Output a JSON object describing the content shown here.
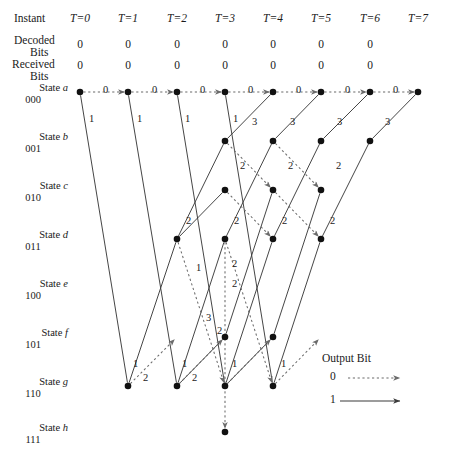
{
  "figure": {
    "type": "trellis-diagram",
    "background": "#ffffff",
    "line_color": "#3b3b3b",
    "node_color": "#111111"
  },
  "header": {
    "instant_label": "Instant",
    "decoded_label_line1": "Decoded",
    "decoded_label_line2": "Bits",
    "received_label_line1": "Received",
    "received_label_line2": "Bits",
    "time_columns": [
      {
        "label": "T=0",
        "x": 80
      },
      {
        "label": "T=1",
        "x": 128
      },
      {
        "label": "T=2",
        "x": 177
      },
      {
        "label": "T=3",
        "x": 225
      },
      {
        "label": "T=4",
        "x": 273
      },
      {
        "label": "T=5",
        "x": 321
      },
      {
        "label": "T=6",
        "x": 370
      },
      {
        "label": "T=7",
        "x": 418
      }
    ],
    "decoded_bits": [
      "0",
      "0",
      "0",
      "0",
      "0",
      "0",
      "0"
    ],
    "received_bits": [
      "0",
      "0",
      "0",
      "0",
      "0",
      "0",
      "0"
    ]
  },
  "states": [
    {
      "key": "a",
      "name": "State a",
      "bits": "000",
      "y": 92
    },
    {
      "key": "b",
      "name": "State b",
      "bits": "001",
      "y": 141
    },
    {
      "key": "c",
      "name": "State c",
      "bits": "010",
      "y": 190
    },
    {
      "key": "d",
      "name": "State d",
      "bits": "011",
      "y": 239
    },
    {
      "key": "e",
      "name": "State e",
      "bits": "100",
      "y": 288
    },
    {
      "key": "f",
      "name": "State f",
      "bits": "101",
      "y": 337
    },
    {
      "key": "g",
      "name": "State g",
      "bits": "110",
      "y": 386
    },
    {
      "key": "h",
      "name": "State h",
      "bits": "111",
      "y": 432
    }
  ],
  "legend": {
    "title": "Output Bit",
    "entries": [
      {
        "label": "0",
        "style": "dotted"
      },
      {
        "label": "1",
        "style": "solid"
      }
    ]
  },
  "chart_data": {
    "type": "diagram",
    "nodes": [
      {
        "id": "a0",
        "state": "a",
        "t": 0,
        "x": 80,
        "y": 92
      },
      {
        "id": "a1",
        "state": "a",
        "t": 1,
        "x": 128,
        "y": 92
      },
      {
        "id": "a2",
        "state": "a",
        "t": 2,
        "x": 177,
        "y": 92
      },
      {
        "id": "a3",
        "state": "a",
        "t": 3,
        "x": 225,
        "y": 92
      },
      {
        "id": "a4",
        "state": "a",
        "t": 4,
        "x": 273,
        "y": 92
      },
      {
        "id": "a5",
        "state": "a",
        "t": 5,
        "x": 321,
        "y": 92
      },
      {
        "id": "a6",
        "state": "a",
        "t": 6,
        "x": 370,
        "y": 92
      },
      {
        "id": "a7",
        "state": "a",
        "t": 7,
        "x": 418,
        "y": 92
      },
      {
        "id": "b3",
        "state": "b",
        "t": 3,
        "x": 225,
        "y": 141
      },
      {
        "id": "b4",
        "state": "b",
        "t": 4,
        "x": 273,
        "y": 141
      },
      {
        "id": "b5",
        "state": "b",
        "t": 5,
        "x": 321,
        "y": 141
      },
      {
        "id": "b6",
        "state": "b",
        "t": 6,
        "x": 370,
        "y": 141
      },
      {
        "id": "c3",
        "state": "c",
        "t": 3,
        "x": 225,
        "y": 190
      },
      {
        "id": "c4",
        "state": "c",
        "t": 4,
        "x": 273,
        "y": 190
      },
      {
        "id": "c5",
        "state": "c",
        "t": 5,
        "x": 321,
        "y": 190
      },
      {
        "id": "d2",
        "state": "d",
        "t": 2,
        "x": 177,
        "y": 239
      },
      {
        "id": "d3",
        "state": "d",
        "t": 3,
        "x": 225,
        "y": 239
      },
      {
        "id": "d4",
        "state": "d",
        "t": 4,
        "x": 273,
        "y": 239
      },
      {
        "id": "d5",
        "state": "d",
        "t": 5,
        "x": 321,
        "y": 239
      },
      {
        "id": "f3",
        "state": "f",
        "t": 3,
        "x": 225,
        "y": 337
      },
      {
        "id": "f4",
        "state": "f",
        "t": 4,
        "x": 273,
        "y": 337
      },
      {
        "id": "g1",
        "state": "g",
        "t": 1,
        "x": 128,
        "y": 386
      },
      {
        "id": "g2",
        "state": "g",
        "t": 2,
        "x": 177,
        "y": 386
      },
      {
        "id": "g3",
        "state": "g",
        "t": 3,
        "x": 225,
        "y": 386
      },
      {
        "id": "g4",
        "state": "g",
        "t": 4,
        "x": 273,
        "y": 386
      },
      {
        "id": "h3",
        "state": "h",
        "t": 3,
        "x": 225,
        "y": 432
      }
    ],
    "edges": [
      {
        "from": [
          80,
          92
        ],
        "to": [
          128,
          92
        ],
        "bit": 0
      },
      {
        "from": [
          128,
          92
        ],
        "to": [
          177,
          92
        ],
        "bit": 0
      },
      {
        "from": [
          177,
          92
        ],
        "to": [
          225,
          92
        ],
        "bit": 0
      },
      {
        "from": [
          225,
          92
        ],
        "to": [
          273,
          92
        ],
        "bit": 0
      },
      {
        "from": [
          273,
          92
        ],
        "to": [
          321,
          92
        ],
        "bit": 0
      },
      {
        "from": [
          321,
          92
        ],
        "to": [
          370,
          92
        ],
        "bit": 0
      },
      {
        "from": [
          370,
          92
        ],
        "to": [
          418,
          92
        ],
        "bit": 0
      },
      {
        "from": [
          80,
          92
        ],
        "to": [
          128,
          386
        ],
        "bit": 1
      },
      {
        "from": [
          128,
          92
        ],
        "to": [
          177,
          386
        ],
        "bit": 1
      },
      {
        "from": [
          177,
          92
        ],
        "to": [
          225,
          386
        ],
        "bit": 1
      },
      {
        "from": [
          225,
          92
        ],
        "to": [
          273,
          386
        ],
        "bit": 1
      },
      {
        "from": [
          177,
          239
        ],
        "to": [
          225,
          141
        ],
        "bit": 1
      },
      {
        "from": [
          225,
          239
        ],
        "to": [
          273,
          141
        ],
        "bit": 1
      },
      {
        "from": [
          273,
          239
        ],
        "to": [
          321,
          141
        ],
        "bit": 1
      },
      {
        "from": [
          321,
          239
        ],
        "to": [
          370,
          141
        ],
        "bit": 1
      },
      {
        "from": [
          225,
          141
        ],
        "to": [
          273,
          92
        ],
        "bit": 1
      },
      {
        "from": [
          273,
          141
        ],
        "to": [
          321,
          92
        ],
        "bit": 1
      },
      {
        "from": [
          321,
          141
        ],
        "to": [
          370,
          92
        ],
        "bit": 1
      },
      {
        "from": [
          370,
          141
        ],
        "to": [
          418,
          92
        ],
        "bit": 1
      },
      {
        "from": [
          128,
          386
        ],
        "to": [
          177,
          239
        ],
        "bit": 1
      },
      {
        "from": [
          177,
          386
        ],
        "to": [
          225,
          239
        ],
        "bit": 1
      },
      {
        "from": [
          225,
          386
        ],
        "to": [
          273,
          239
        ],
        "bit": 1
      },
      {
        "from": [
          273,
          386
        ],
        "to": [
          321,
          239
        ],
        "bit": 1
      },
      {
        "from": [
          177,
          386
        ],
        "to": [
          225,
          337
        ],
        "bit": 1
      },
      {
        "from": [
          225,
          386
        ],
        "to": [
          273,
          337
        ],
        "bit": 1
      },
      {
        "from": [
          225,
          337
        ],
        "to": [
          273,
          190
        ],
        "bit": 1
      },
      {
        "from": [
          273,
          337
        ],
        "to": [
          321,
          190
        ],
        "bit": 1
      },
      {
        "from": [
          177,
          239
        ],
        "to": [
          225,
          190
        ],
        "bit": 1
      },
      {
        "from": [
          128,
          386
        ],
        "to": [
          177,
          337
        ],
        "bit": 0
      },
      {
        "from": [
          177,
          386
        ],
        "to": [
          225,
          337
        ],
        "bit": 0
      },
      {
        "from": [
          225,
          386
        ],
        "to": [
          273,
          337
        ],
        "bit": 0
      },
      {
        "from": [
          273,
          386
        ],
        "to": [
          321,
          337
        ],
        "bit": 0
      },
      {
        "from": [
          177,
          239
        ],
        "to": [
          225,
          386
        ],
        "bit": 0
      },
      {
        "from": [
          225,
          239
        ],
        "to": [
          273,
          386
        ],
        "bit": 0
      },
      {
        "from": [
          225,
          239
        ],
        "to": [
          225,
          432
        ],
        "bit": 0
      },
      {
        "from": [
          225,
          141
        ],
        "to": [
          273,
          190
        ],
        "bit": 0
      },
      {
        "from": [
          273,
          141
        ],
        "to": [
          321,
          190
        ],
        "bit": 0
      },
      {
        "from": [
          225,
          190
        ],
        "to": [
          273,
          239
        ],
        "bit": 0
      },
      {
        "from": [
          273,
          190
        ],
        "to": [
          321,
          239
        ],
        "bit": 0
      }
    ],
    "path_metric_labels": [
      {
        "text": "0",
        "x": 103,
        "y": 84
      },
      {
        "text": "0",
        "x": 152,
        "y": 84
      },
      {
        "text": "0",
        "x": 200,
        "y": 84
      },
      {
        "text": "0",
        "x": 248,
        "y": 84
      },
      {
        "text": "0",
        "x": 296,
        "y": 84
      },
      {
        "text": "0",
        "x": 345,
        "y": 84
      },
      {
        "text": "0",
        "x": 393,
        "y": 84
      },
      {
        "text": "1",
        "x": 89,
        "y": 113
      },
      {
        "text": "1",
        "x": 137,
        "y": 113
      },
      {
        "text": "1",
        "x": 185,
        "y": 113
      },
      {
        "text": "1",
        "x": 233,
        "y": 113
      },
      {
        "text": "3",
        "x": 252,
        "y": 116
      },
      {
        "text": "3",
        "x": 290,
        "y": 116
      },
      {
        "text": "3",
        "x": 337,
        "y": 116
      },
      {
        "text": "3",
        "x": 385,
        "y": 116
      },
      {
        "text": "2",
        "x": 240,
        "y": 160
      },
      {
        "text": "2",
        "x": 288,
        "y": 160
      },
      {
        "text": "2",
        "x": 336,
        "y": 160
      },
      {
        "text": "2",
        "x": 186,
        "y": 215
      },
      {
        "text": "2",
        "x": 234,
        "y": 215
      },
      {
        "text": "2",
        "x": 282,
        "y": 215
      },
      {
        "text": "2",
        "x": 330,
        "y": 215
      },
      {
        "text": "1",
        "x": 196,
        "y": 262
      },
      {
        "text": "2",
        "x": 232,
        "y": 258
      },
      {
        "text": "2",
        "x": 232,
        "y": 278
      },
      {
        "text": "3",
        "x": 206,
        "y": 312
      },
      {
        "text": "2",
        "x": 217,
        "y": 325
      },
      {
        "text": "1",
        "x": 133,
        "y": 358
      },
      {
        "text": "2",
        "x": 143,
        "y": 372
      },
      {
        "text": "1",
        "x": 182,
        "y": 358
      },
      {
        "text": "2",
        "x": 192,
        "y": 372
      },
      {
        "text": "1",
        "x": 232,
        "y": 358
      },
      {
        "text": "1",
        "x": 281,
        "y": 358
      }
    ]
  }
}
